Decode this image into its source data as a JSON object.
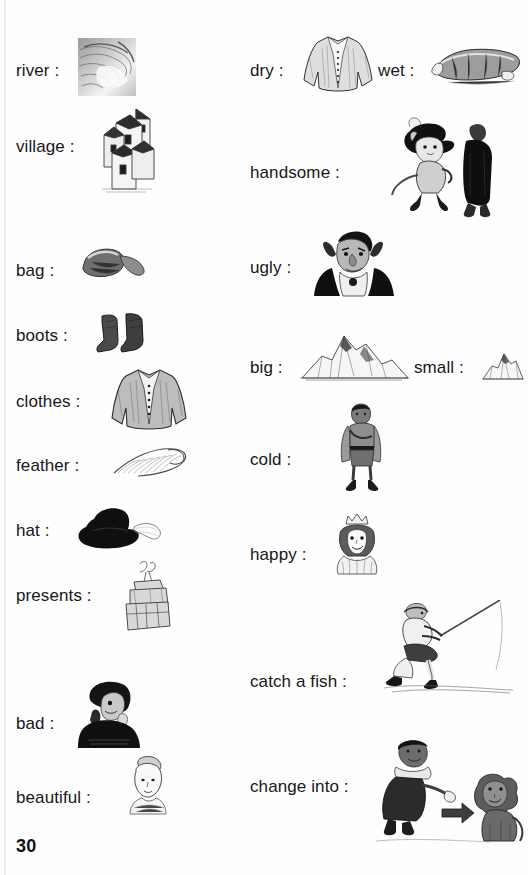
{
  "page": {
    "number": "30",
    "background_color": "#fefefe",
    "text_color": "#17171a",
    "width": 528,
    "height": 875
  },
  "columns": {
    "left": {
      "entries": [
        {
          "label": "river :",
          "illustration": "river-sketch",
          "label_x": 16,
          "label_y": 61,
          "img_x": 78,
          "img_y": 38,
          "img_w": 58,
          "img_h": 58
        },
        {
          "label": "village :",
          "illustration": "village-sketch",
          "label_x": 16,
          "label_y": 137,
          "img_x": 96,
          "img_y": 105,
          "img_w": 62,
          "img_h": 90
        },
        {
          "label": "bag :",
          "illustration": "bag-sketch",
          "label_x": 16,
          "label_y": 261,
          "img_x": 76,
          "img_y": 244,
          "img_w": 72,
          "img_h": 40
        },
        {
          "label": "boots :",
          "illustration": "boots-sketch",
          "label_x": 16,
          "label_y": 326,
          "img_x": 96,
          "img_y": 312,
          "img_w": 58,
          "img_h": 44
        },
        {
          "label": "clothes :",
          "illustration": "clothes-sketch",
          "label_x": 16,
          "label_y": 392,
          "img_x": 110,
          "img_y": 366,
          "img_w": 78,
          "img_h": 68
        },
        {
          "label": "feather :",
          "illustration": "feather-sketch",
          "label_x": 16,
          "label_y": 456,
          "img_x": 110,
          "img_y": 443,
          "img_w": 80,
          "img_h": 38
        },
        {
          "label": "hat :",
          "illustration": "hat-sketch",
          "label_x": 16,
          "label_y": 521,
          "img_x": 72,
          "img_y": 505,
          "img_w": 92,
          "img_h": 48
        },
        {
          "label": "presents :",
          "illustration": "presents-sketch",
          "label_x": 16,
          "label_y": 586,
          "img_x": 116,
          "img_y": 560,
          "img_w": 62,
          "img_h": 74
        },
        {
          "label": "bad :",
          "illustration": "bad-sketch",
          "label_x": 16,
          "label_y": 714,
          "img_x": 74,
          "img_y": 678,
          "img_w": 70,
          "img_h": 70
        },
        {
          "label": "beautiful :",
          "illustration": "beautiful-sketch",
          "label_x": 16,
          "label_y": 788,
          "img_x": 122,
          "img_y": 754,
          "img_w": 52,
          "img_h": 62
        }
      ]
    },
    "right": {
      "entries": [
        {
          "label": "dry :",
          "illustration": "dry-jacket-sketch",
          "label_x": 250,
          "label_y": 61,
          "img_x": 302,
          "img_y": 34,
          "img_w": 72,
          "img_h": 62
        },
        {
          "label": "wet :",
          "illustration": "wet-jacket-sketch",
          "label_x": 378,
          "label_y": 61,
          "img_x": 430,
          "img_y": 44,
          "img_w": 94,
          "img_h": 42
        },
        {
          "label": "handsome :",
          "illustration": "handsome-cat-sketch",
          "label_x": 250,
          "label_y": 163,
          "img_x": 386,
          "img_y": 113,
          "img_w": 116,
          "img_h": 106
        },
        {
          "label": "ugly :",
          "illustration": "ugly-ogre-sketch",
          "label_x": 250,
          "label_y": 258,
          "img_x": 302,
          "img_y": 228,
          "img_w": 104,
          "img_h": 70
        },
        {
          "label": "big :",
          "illustration": "big-mountain-sketch",
          "label_x": 250,
          "label_y": 358,
          "img_x": 300,
          "img_y": 330,
          "img_w": 110,
          "img_h": 52
        },
        {
          "label": "small :",
          "illustration": "small-mountain-sketch",
          "label_x": 414,
          "label_y": 358,
          "img_x": 482,
          "img_y": 350,
          "img_w": 42,
          "img_h": 32
        },
        {
          "label": "cold :",
          "illustration": "cold-boy-sketch",
          "label_x": 250,
          "label_y": 450,
          "img_x": 336,
          "img_y": 400,
          "img_w": 52,
          "img_h": 94
        },
        {
          "label": "happy :",
          "illustration": "happy-princess-sketch",
          "label_x": 250,
          "label_y": 545,
          "img_x": 326,
          "img_y": 512,
          "img_w": 62,
          "img_h": 66
        },
        {
          "label": "catch a fish :",
          "illustration": "fishing-sketch",
          "label_x": 250,
          "label_y": 672,
          "img_x": 384,
          "img_y": 600,
          "img_w": 130,
          "img_h": 96
        },
        {
          "label": "change into :",
          "illustration": "change-into-sketch",
          "label_x": 250,
          "label_y": 777,
          "img_x": 370,
          "img_y": 737,
          "img_w": 155,
          "img_h": 110
        }
      ]
    }
  }
}
